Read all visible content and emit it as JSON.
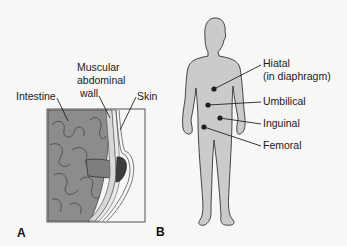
{
  "panel_a": {
    "letter": "A",
    "labels": {
      "intestine": "Intestine",
      "muscular_line1": "Muscular",
      "muscular_line2": "abdominal",
      "muscular_line3": "wall",
      "skin": "Skin"
    }
  },
  "panel_b": {
    "letter": "B",
    "labels": {
      "hiatal_line1": "Hiatal",
      "hiatal_line2": "(in diaphragm)",
      "umbilical": "Umbilical",
      "inguinal": "Inguinal",
      "femoral": "Femoral"
    }
  },
  "colors": {
    "background": "#f7f7f5",
    "intestine": "#8a8a8a",
    "wall": "#cfcfcf",
    "body": "#cbcbcb",
    "dot": "#1e1e1e",
    "hernia": "#3c3c3c"
  }
}
